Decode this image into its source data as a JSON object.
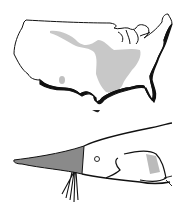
{
  "figure": {
    "panels": [
      {
        "name": "us-range-map",
        "description": "Outline map of the contiguous United States with shaded gray species range over the Mississippi basin"
      },
      {
        "name": "paddlefish-head",
        "description": "Line drawing of a paddlefish head with long gray paddle-shaped snout"
      }
    ],
    "colors": {
      "outline": "#111111",
      "range_shade": "#c8c8c8",
      "snout_shade": "#8a8a8a",
      "background": "#ffffff"
    }
  }
}
